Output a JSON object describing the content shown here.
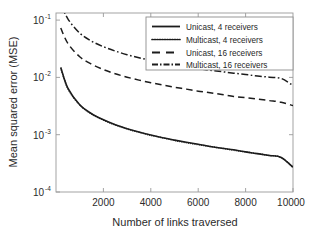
{
  "chart_data": {
    "type": "line",
    "title": "",
    "xlabel": "Number of links traversed",
    "ylabel": "Mean squared error (MSE)",
    "xlim": [
      0,
      10000
    ],
    "ylim": [
      0.0001,
      0.1
    ],
    "yscale": "log",
    "xscale": "linear",
    "grid": false,
    "legend_position": "upper right",
    "xticks": [
      "2000",
      "4000",
      "6000",
      "8000",
      "10000"
    ],
    "xtick_values": [
      2000,
      4000,
      6000,
      8000,
      10000
    ],
    "yticks": [
      "10^-1",
      "10^-2",
      "10^-3",
      "10^-4"
    ],
    "ytick_values": [
      0.1,
      0.01,
      0.001,
      0.0001
    ],
    "ytick_base": "10",
    "ytick_exponents": [
      "-1",
      "-2",
      "-3",
      "-4"
    ],
    "x": [
      200,
      500,
      1000,
      1500,
      2000,
      2500,
      3000,
      3500,
      4000,
      4500,
      5000,
      5500,
      6000,
      6500,
      7000,
      7500,
      8000,
      8500,
      9000,
      9500,
      10000
    ],
    "series": [
      {
        "name": "Unicast, 4 receivers",
        "linestyle": "solid",
        "color": "#1c1c1c",
        "values": [
          0.0122,
          0.0055,
          0.0029,
          0.00205,
          0.00162,
          0.00134,
          0.00115,
          0.00101,
          0.0009,
          0.00081,
          0.00074,
          0.00068,
          0.00063,
          0.00058,
          0.00054,
          0.00051,
          0.00047,
          0.00044,
          0.00041,
          0.00038,
          0.00026
        ]
      },
      {
        "name": "Multicast, 4 receivers",
        "linestyle": "dotted",
        "color": "#1c1c1c",
        "values": [
          0.0121,
          0.0054,
          0.00288,
          0.00203,
          0.00161,
          0.00133,
          0.00114,
          0.001,
          0.00089,
          0.00081,
          0.00073,
          0.00067,
          0.00062,
          0.00058,
          0.00054,
          0.0005,
          0.00047,
          0.00044,
          0.00041,
          0.00038,
          0.00026
        ]
      },
      {
        "name": "Unicast, 16 receivers",
        "linestyle": "dashed",
        "color": "#1c1c1c",
        "values": [
          0.056,
          0.031,
          0.0185,
          0.0139,
          0.0113,
          0.0096,
          0.0084,
          0.0075,
          0.0068,
          0.0062,
          0.0057,
          0.0053,
          0.0049,
          0.0046,
          0.0043,
          0.004,
          0.0038,
          0.0036,
          0.0034,
          0.0032,
          0.0028
        ]
      },
      {
        "name": "Multicast, 16 receivers",
        "linestyle": "dashdot",
        "color": "#1c1c1c",
        "values": [
          0.145,
          0.08,
          0.046,
          0.0338,
          0.0272,
          0.023,
          0.02,
          0.0178,
          0.0161,
          0.0147,
          0.0136,
          0.0126,
          0.0117,
          0.011,
          0.0104,
          0.0098,
          0.0093,
          0.0088,
          0.0084,
          0.008,
          0.0061
        ]
      }
    ]
  },
  "legend": {
    "entries": [
      {
        "label": "Unicast, 4 receivers",
        "style": "solid"
      },
      {
        "label": "Multicast, 4 receivers",
        "style": "dotted"
      },
      {
        "label": "Unicast, 16 receivers",
        "style": "dashed"
      },
      {
        "label": "Multicast, 16 receivers",
        "style": "dashdot"
      }
    ]
  },
  "axes": {
    "x_title": "Number of links traversed",
    "y_title": "Mean squared error (MSE)",
    "x_tick_labels": [
      "2000",
      "4000",
      "6000",
      "8000",
      "10000"
    ],
    "y_tick_mantissa": "10",
    "y_tick_exponents": [
      "-1",
      "-2",
      "-3",
      "-4"
    ]
  },
  "colors": {
    "line": "#1c1c1c",
    "frame": "#9a9a9a",
    "background": "#ffffff",
    "text": "#2b2b2b"
  }
}
